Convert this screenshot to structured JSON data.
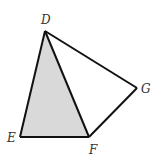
{
  "diagram": {
    "shape": "quadrilateral-with-triangle",
    "points": {
      "D": {
        "label": "D",
        "x": 45,
        "y": 31
      },
      "E": {
        "label": "E",
        "x": 20,
        "y": 137
      },
      "F": {
        "label": "F",
        "x": 89,
        "y": 137
      },
      "G": {
        "label": "G",
        "x": 137,
        "y": 88
      }
    },
    "shaded_triangle": "DEF",
    "colors": {
      "shading": "#d9d9d9",
      "stroke": "#111111"
    }
  }
}
